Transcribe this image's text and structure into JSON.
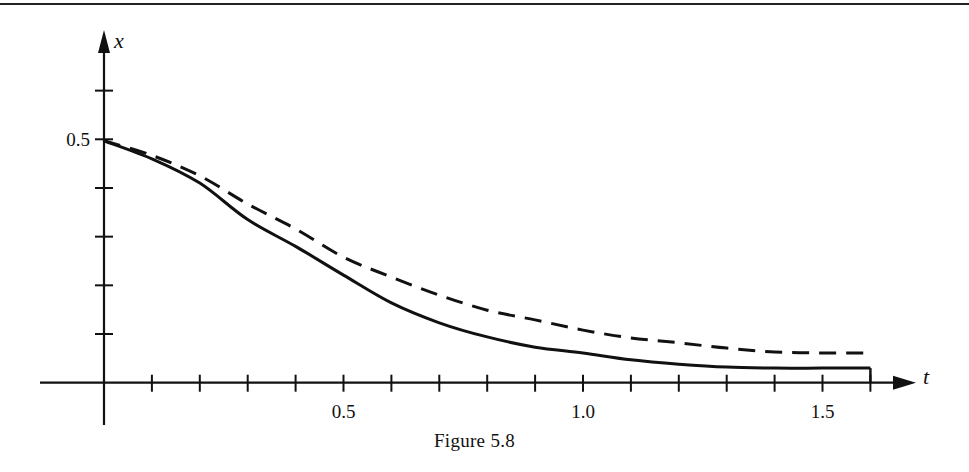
{
  "figure": {
    "caption": "Figure 5.8",
    "top_rule_color": "#222222",
    "ink_color": "#111111"
  },
  "chart_data": {
    "type": "line",
    "title": "",
    "caption": "Figure 5.8",
    "xlabel": "t",
    "ylabel": "x",
    "xlim": [
      0,
      1.6
    ],
    "ylim": [
      0,
      0.6
    ],
    "grid": false,
    "legend": null,
    "x_ticks": [
      0.1,
      0.2,
      0.3,
      0.4,
      0.5,
      0.6,
      0.7,
      0.8,
      0.9,
      1.0,
      1.1,
      1.2,
      1.3,
      1.4,
      1.5,
      1.6
    ],
    "x_tick_labels": [
      {
        "value": 0.5,
        "label": "0.5"
      },
      {
        "value": 1.0,
        "label": "1.0"
      },
      {
        "value": 1.5,
        "label": "1.5"
      }
    ],
    "y_ticks": [
      0.1,
      0.2,
      0.3,
      0.4,
      0.5,
      0.6
    ],
    "y_tick_labels": [
      {
        "value": 0.5,
        "label": "0.5"
      }
    ],
    "x": [
      0,
      0.1,
      0.2,
      0.3,
      0.4,
      0.5,
      0.6,
      0.7,
      0.8,
      0.9,
      1.0,
      1.1,
      1.2,
      1.3,
      1.4,
      1.5,
      1.6
    ],
    "series": [
      {
        "name": "solid",
        "style": "solid",
        "values": [
          0.497,
          0.46,
          0.41,
          0.335,
          0.28,
          0.221,
          0.164,
          0.123,
          0.094,
          0.073,
          0.061,
          0.047,
          0.038,
          0.032,
          0.03,
          0.03,
          0.03
        ],
        "end_drop_to_axis": true
      },
      {
        "name": "dashed",
        "style": "dashed",
        "values": [
          0.497,
          0.467,
          0.425,
          0.367,
          0.316,
          0.258,
          0.217,
          0.18,
          0.149,
          0.129,
          0.108,
          0.092,
          0.082,
          0.071,
          0.063,
          0.061,
          0.061
        ]
      }
    ]
  }
}
